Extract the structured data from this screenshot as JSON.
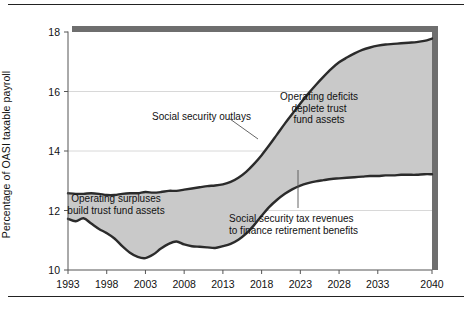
{
  "figure": {
    "background": "#ffffff",
    "frame_color": "#222222",
    "fill_color": "#c9c9c9",
    "line_color": "#2b2b2b",
    "shadow_color": "#6e6e6e"
  },
  "chart_data": {
    "type": "area",
    "title": "",
    "subtitle": "",
    "xlabel": "",
    "ylabel": "Percentage of OASI taxable payroll",
    "xlim": [
      1993,
      2040
    ],
    "ylim": [
      10,
      18
    ],
    "grid": true,
    "grid_values": [
      12,
      14,
      16
    ],
    "legend_position": "none",
    "xticks": [
      "1993",
      "1998",
      "2003",
      "2008",
      "2013",
      "2018",
      "2023",
      "2028",
      "2033",
      "2040"
    ],
    "xtick_values": [
      1993,
      1998,
      2003,
      2008,
      2013,
      2018,
      2023,
      2028,
      2033,
      2040
    ],
    "yticks": [
      "10",
      "12",
      "14",
      "16",
      "18"
    ],
    "ytick_values": [
      10,
      12,
      14,
      16,
      18
    ],
    "x": [
      1993,
      1994,
      1995,
      1996,
      1997,
      1998,
      1999,
      2000,
      2001,
      2002,
      2003,
      2004,
      2005,
      2006,
      2007,
      2008,
      2009,
      2010,
      2011,
      2012,
      2013,
      2014,
      2015,
      2016,
      2017,
      2018,
      2019,
      2020,
      2021,
      2022,
      2023,
      2024,
      2025,
      2026,
      2027,
      2028,
      2029,
      2030,
      2031,
      2032,
      2033,
      2034,
      2035,
      2036,
      2037,
      2038,
      2039,
      2040
    ],
    "series": [
      {
        "name": "Social security outlays",
        "values": [
          12.58,
          12.56,
          12.56,
          12.58,
          12.56,
          12.52,
          12.52,
          12.56,
          12.58,
          12.58,
          12.62,
          12.6,
          12.62,
          12.66,
          12.66,
          12.7,
          12.74,
          12.78,
          12.82,
          12.84,
          12.88,
          12.96,
          13.1,
          13.3,
          13.56,
          13.86,
          14.2,
          14.56,
          14.92,
          15.26,
          15.6,
          15.92,
          16.22,
          16.5,
          16.76,
          16.98,
          17.14,
          17.28,
          17.4,
          17.48,
          17.54,
          17.58,
          17.6,
          17.62,
          17.64,
          17.66,
          17.7,
          17.78
        ]
      },
      {
        "name": "Social security tax revenues to finance retirement benefits",
        "values": [
          11.72,
          11.64,
          11.74,
          11.56,
          11.38,
          11.24,
          11.06,
          10.8,
          10.58,
          10.44,
          10.4,
          10.52,
          10.72,
          10.88,
          10.96,
          10.86,
          10.8,
          10.78,
          10.76,
          10.74,
          10.8,
          10.88,
          11.02,
          11.22,
          11.5,
          11.82,
          12.12,
          12.36,
          12.56,
          12.72,
          12.84,
          12.92,
          12.98,
          13.02,
          13.06,
          13.08,
          13.1,
          13.12,
          13.14,
          13.16,
          13.16,
          13.18,
          13.18,
          13.2,
          13.2,
          13.2,
          13.22,
          13.22
        ]
      }
    ],
    "fill_regions": [
      {
        "name": "Operating surpluses build trust fund assets",
        "from_year": 1993,
        "to_year": 2017
      },
      {
        "name": "Operating deficits deplete trust fund assets",
        "from_year": 2017,
        "to_year": 2040
      }
    ],
    "annotations": [
      {
        "id": "outlays",
        "text": "Social security outlays",
        "lines": [
          "Social security outlays"
        ],
        "x": 152,
        "y": 111,
        "align": "left",
        "leader": {
          "x1": 230,
          "y1": 119,
          "x2": 258,
          "y2": 139
        }
      },
      {
        "id": "deficits",
        "text": "Operating deficits deplete trust fund assets",
        "lines": [
          "Operating deficits",
          "deplete trust",
          "fund assets"
        ],
        "x": 319,
        "y": 91,
        "align": "center",
        "leader": null
      },
      {
        "id": "surpluses",
        "text": "Operating surpluses build trust fund assets",
        "lines": [
          "Operating surpluses",
          "build trust fund assets"
        ],
        "x": 116,
        "y": 193,
        "align": "center",
        "leader": null
      },
      {
        "id": "tax-revenues",
        "text": "Social security tax revenues to finance retirement benefits",
        "lines": [
          "Social security tax revenues",
          "to finance retirement benefits"
        ],
        "x": 229,
        "y": 213,
        "align": "left",
        "leader": {
          "x1": 298,
          "y1": 170,
          "x2": 298,
          "y2": 208
        }
      }
    ]
  }
}
